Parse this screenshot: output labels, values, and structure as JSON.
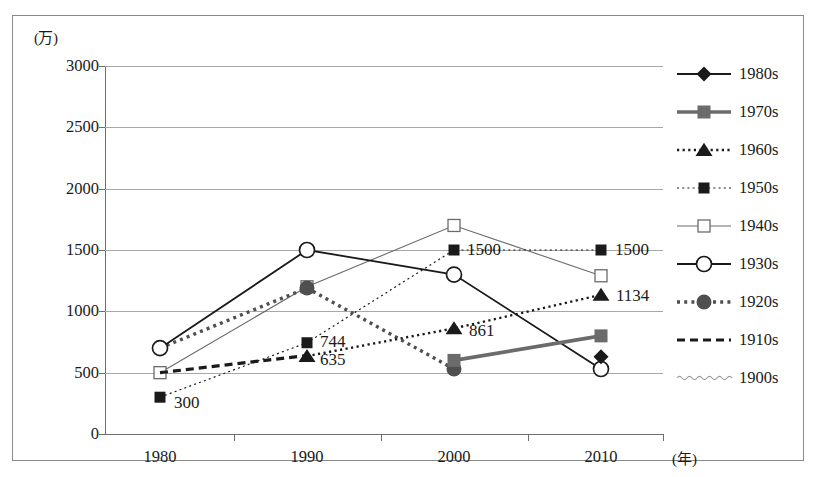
{
  "chart_data": {
    "type": "line",
    "title": "",
    "xlabel": "(年)",
    "ylabel": "(万)",
    "x": [
      1980,
      1990,
      2000,
      2010
    ],
    "xtick_labels": [
      "1980",
      "1990",
      "2000",
      "2010"
    ],
    "ytick_labels": [
      "0",
      "500",
      "1000",
      "1500",
      "2000",
      "2500",
      "3000"
    ],
    "yticks": [
      0,
      500,
      1000,
      1500,
      2000,
      2500,
      3000
    ],
    "ylim": [
      0,
      3000
    ],
    "grid": true,
    "legend_position": "right",
    "series": [
      {
        "name": "1980s",
        "x": [
          2010
        ],
        "values": [
          630
        ],
        "marker": "filled-diamond",
        "line": "solid",
        "color": "#1a1a1a"
      },
      {
        "name": "1970s",
        "x": [
          2000,
          2010
        ],
        "values": [
          600,
          800
        ],
        "marker": "filled-square",
        "line": "solid-thick",
        "color": "#6b6b6b"
      },
      {
        "name": "1960s",
        "x": [
          1990,
          2000,
          2010
        ],
        "values": [
          635,
          861,
          1134
        ],
        "marker": "filled-triangle",
        "line": "dotted",
        "color": "#1a1a1a"
      },
      {
        "name": "1950s",
        "x": [
          1980,
          1990,
          2000,
          2010
        ],
        "values": [
          300,
          744,
          1500,
          1500
        ],
        "marker": "filled-square-small",
        "line": "fine-dotted",
        "color": "#1a1a1a"
      },
      {
        "name": "1940s",
        "x": [
          1980,
          1990,
          2000,
          2010
        ],
        "values": [
          500,
          1200,
          1700,
          1290
        ],
        "marker": "open-square",
        "line": "thin-solid",
        "color": "#6b6b6b"
      },
      {
        "name": "1930s",
        "x": [
          1980,
          1990,
          2000,
          2010
        ],
        "values": [
          700,
          1500,
          1300,
          530
        ],
        "marker": "open-circle",
        "line": "solid",
        "color": "#1a1a1a"
      },
      {
        "name": "1920s",
        "x": [
          1980,
          1990,
          2000
        ],
        "values": [
          700,
          1190,
          530
        ],
        "marker": "filled-circle-gray",
        "line": "thick-dotted",
        "color": "#4f4f4f"
      },
      {
        "name": "1910s",
        "x": [
          1980,
          1990
        ],
        "values": [
          500,
          640
        ],
        "marker": "none",
        "line": "dashed",
        "color": "#1a1a1a"
      },
      {
        "name": "1900s",
        "x": [],
        "values": [],
        "marker": "none",
        "line": "wavy",
        "color": "#9a9a9a"
      }
    ],
    "data_labels": [
      {
        "text": "300",
        "series": "1950s",
        "x": 1980,
        "value": 300
      },
      {
        "text": "744",
        "series": "1950s",
        "x": 1990,
        "value": 744
      },
      {
        "text": "635",
        "series": "1960s",
        "x": 1990,
        "value": 635
      },
      {
        "text": "1500",
        "series": "1950s",
        "x": 2000,
        "value": 1500
      },
      {
        "text": "861",
        "series": "1960s",
        "x": 2000,
        "value": 861
      },
      {
        "text": "1500",
        "series": "1950s",
        "x": 2010,
        "value": 1500
      },
      {
        "text": "1134",
        "series": "1960s",
        "x": 2010,
        "value": 1134
      }
    ]
  },
  "legend": {
    "items": [
      {
        "label": "1980s"
      },
      {
        "label": "1970s"
      },
      {
        "label": "1960s"
      },
      {
        "label": "1950s"
      },
      {
        "label": "1940s"
      },
      {
        "label": "1930s"
      },
      {
        "label": "1920s"
      },
      {
        "label": "1910s"
      },
      {
        "label": "1900s"
      }
    ]
  },
  "axes": {
    "y_unit": "(万)",
    "x_unit": "(年)"
  }
}
